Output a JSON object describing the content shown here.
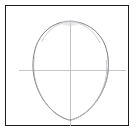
{
  "image": {
    "kind": "pencil-drawing",
    "subject": "head construction guide",
    "description": "Egg-shaped head outline with vertical centerline and horizontal eyeline guide, drawn in pencil inside a thin dark rectangular frame",
    "background_color": "#ffffff",
    "frame_color": "#1c1c1c",
    "outline_color": "#6e6e72",
    "guide_color": "#b4b4b8",
    "sketch_echo_color": "#a9a9ae"
  },
  "frame": {
    "x": 5,
    "y": 5,
    "width": 124,
    "height": 121,
    "stroke_width": 1.5
  },
  "drawing": {
    "egg": {
      "top_x": 70,
      "top_y": 21,
      "bottom_x": 70,
      "bottom_y": 120,
      "left_x": 33,
      "right_x": 108,
      "widest_y": 58,
      "stroke_width": 0.9
    },
    "vertical_guide": {
      "x": 70,
      "y_start": 21,
      "y_end": 126,
      "stroke_width": 0.8
    },
    "horizontal_guide": {
      "y": 70,
      "x_start": 19,
      "x_end": 126,
      "stroke_width": 0.8
    }
  }
}
